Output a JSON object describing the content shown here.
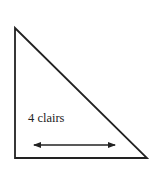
{
  "diagram": {
    "shape": "right-triangle",
    "label": "4 clairs",
    "arrow": "double-headed",
    "colors": {
      "stroke": "#222222",
      "background": "#ffffff"
    }
  }
}
